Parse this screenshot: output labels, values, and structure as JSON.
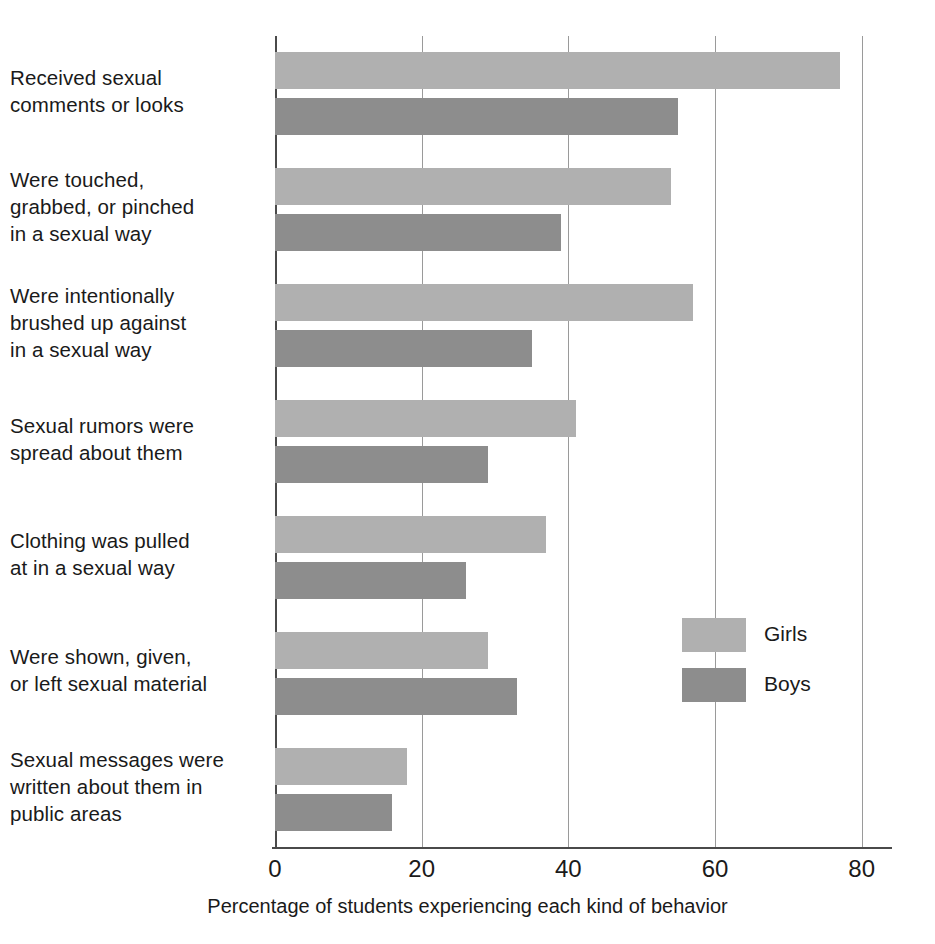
{
  "chart_data": {
    "type": "bar",
    "orientation": "horizontal",
    "title": "",
    "xlabel": "Percentage of students experiencing each kind of behavior",
    "ylabel": "",
    "xlim": [
      0,
      85
    ],
    "xticks": [
      0,
      20,
      40,
      60,
      80
    ],
    "xtick_labels": [
      "0",
      "20",
      "40",
      "60",
      "80"
    ],
    "grid": true,
    "legend_position": "inside-right",
    "categories": [
      "Received sexual comments or looks",
      "Were touched, grabbed, or pinched in a sexual way",
      "Were intentionally brushed up against in a sexual way",
      "Sexual rumors were spread about them",
      "Clothing was pulled at in a sexual way",
      "Were shown, given, or left sexual material",
      "Sexual messages were written about them in public areas"
    ],
    "category_lines": [
      [
        "Received sexual",
        "comments or looks"
      ],
      [
        "Were touched,",
        "grabbed, or pinched",
        "in a sexual way"
      ],
      [
        "Were intentionally",
        "brushed up against",
        "in a sexual way"
      ],
      [
        "Sexual rumors were",
        "spread about them"
      ],
      [
        "Clothing was pulled",
        "at in a sexual way"
      ],
      [
        "Were shown, given,",
        "or left sexual material"
      ],
      [
        "Sexual messages were",
        "written about them in",
        "public areas"
      ]
    ],
    "series": [
      {
        "name": "Girls",
        "color": "#b0b0b0",
        "values": [
          77,
          54,
          57,
          41,
          37,
          29,
          18
        ]
      },
      {
        "name": "Boys",
        "color": "#8d8d8d",
        "values": [
          55,
          39,
          35,
          29,
          26,
          33,
          16
        ]
      }
    ]
  },
  "legend": {
    "items": [
      {
        "label": "Girls",
        "color": "#b0b0b0"
      },
      {
        "label": "Boys",
        "color": "#8d8d8d"
      }
    ]
  }
}
